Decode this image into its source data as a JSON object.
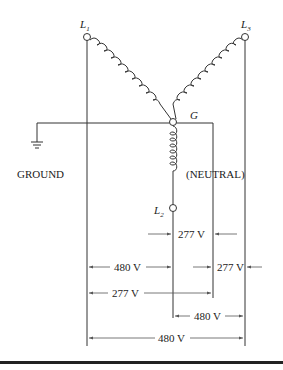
{
  "figure": {
    "type": "wye-connected transformer secondary (277/480 V)",
    "nodes": {
      "l1": {
        "label": "L",
        "subscript": "1"
      },
      "l2": {
        "label": "L",
        "subscript": "2"
      },
      "l3": {
        "label": "L",
        "subscript": "3"
      },
      "g": {
        "label": "G"
      }
    },
    "labels": {
      "ground": "GROUND",
      "neutral": "(NEUTRAL)"
    },
    "voltages": {
      "l2_to_neutral": "277 V",
      "l1_to_l2": "480 V",
      "l3_to_neutral": "277 V",
      "l1_to_neutral": "277 V",
      "l2_to_l3": "480 V",
      "l1_to_l3": "480 V"
    }
  }
}
